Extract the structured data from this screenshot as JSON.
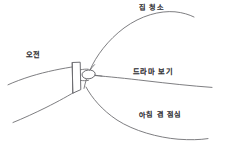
{
  "diagram": {
    "type": "hand-drawn-mind-map",
    "title": "",
    "background_color": "#ffffff",
    "stroke_color": "#6f6f73",
    "text_color": "#3a3a3e",
    "center": {
      "name": "center-hub",
      "label": "",
      "shapes": [
        "rectangle",
        "ellipse"
      ]
    },
    "branches": [
      {
        "id": "branch-am",
        "label": "오전",
        "direction": "left"
      },
      {
        "id": "branch-cleaning",
        "label": "집 청소",
        "direction": "upper-right"
      },
      {
        "id": "branch-drama",
        "label": "드라마 보기",
        "direction": "right"
      },
      {
        "id": "branch-brunch",
        "label": "아침 겸 점심",
        "direction": "lower-right"
      }
    ]
  }
}
